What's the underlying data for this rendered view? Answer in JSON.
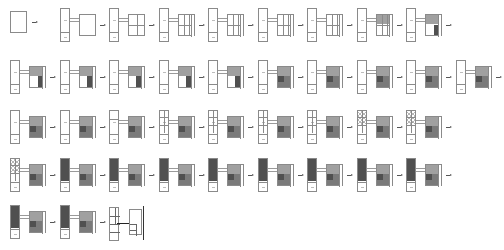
{
  "diagram": {
    "title": "",
    "colors": {
      "line": "#8a8a8a",
      "fill_light": "#a0a0a0",
      "fill_mid": "#7a7a7a",
      "fill_dark": "#505050",
      "arrow": "#555555",
      "background": "#ffffff"
    },
    "rows": [
      {
        "row": 1,
        "steps": [
          {
            "id": 1,
            "variant": "single-square",
            "fill": "empty"
          },
          {
            "id": 2,
            "variant": "tower-square",
            "fill": "empty"
          },
          {
            "id": 3,
            "variant": "tower-square",
            "fill": "grid-2x2"
          },
          {
            "id": 4,
            "variant": "tower-square",
            "fill": "grid-3x2"
          },
          {
            "id": 5,
            "variant": "tower-square",
            "fill": "crossed-grid"
          },
          {
            "id": 6,
            "variant": "tower-square",
            "fill": "crossed-grid"
          },
          {
            "id": 7,
            "variant": "tower-square",
            "fill": "crossed-grid"
          },
          {
            "id": 8,
            "variant": "tower-square",
            "fill": "partial-shade"
          },
          {
            "id": 9,
            "variant": "tower-square",
            "fill": "partial-shade-dark"
          }
        ]
      },
      {
        "row": 2,
        "steps": [
          {
            "id": 10,
            "variant": "tower-square",
            "fill": "shaded-L"
          },
          {
            "id": 11,
            "variant": "tower-square",
            "fill": "shaded-dots"
          },
          {
            "id": 12,
            "variant": "tower-square",
            "fill": "shaded-dots"
          },
          {
            "id": 13,
            "variant": "tower-square",
            "fill": "shaded-dots"
          },
          {
            "id": 14,
            "variant": "tower-square",
            "fill": "shaded-dots"
          },
          {
            "id": 15,
            "variant": "tower-square",
            "fill": "shaded-full"
          },
          {
            "id": 16,
            "variant": "tower-square",
            "fill": "shaded-full"
          },
          {
            "id": 17,
            "variant": "tower-square",
            "fill": "shaded-full"
          },
          {
            "id": 18,
            "variant": "tower-square",
            "fill": "shaded-full"
          },
          {
            "id": 19,
            "variant": "tower-square",
            "fill": "shaded-full"
          }
        ]
      },
      {
        "row": 3,
        "steps": [
          {
            "id": 20,
            "variant": "tower-square",
            "fill": "shaded-full"
          },
          {
            "id": 21,
            "variant": "tower-square",
            "fill": "shaded-full"
          },
          {
            "id": 22,
            "variant": "tower-divided",
            "fill": "shaded-full"
          },
          {
            "id": 23,
            "variant": "tower-grid",
            "fill": "shaded-full"
          },
          {
            "id": 24,
            "variant": "tower-grid",
            "fill": "shaded-full"
          },
          {
            "id": 25,
            "variant": "tower-grid",
            "fill": "shaded-full"
          },
          {
            "id": 26,
            "variant": "tower-grid",
            "fill": "shaded-full"
          },
          {
            "id": 27,
            "variant": "tower-detail",
            "fill": "shaded-full"
          },
          {
            "id": 28,
            "variant": "tower-detail",
            "fill": "shaded-full"
          }
        ]
      },
      {
        "row": 4,
        "steps": [
          {
            "id": 29,
            "variant": "tower-detail",
            "fill": "shaded-full"
          },
          {
            "id": 30,
            "variant": "tower-shaded",
            "fill": "shaded-full"
          },
          {
            "id": 31,
            "variant": "tower-shaded",
            "fill": "shaded-full"
          },
          {
            "id": 32,
            "variant": "tower-shaded",
            "fill": "shaded-full"
          },
          {
            "id": 33,
            "variant": "tower-shaded",
            "fill": "shaded-full"
          },
          {
            "id": 34,
            "variant": "tower-shaded",
            "fill": "shaded-full"
          },
          {
            "id": 35,
            "variant": "tower-shaded",
            "fill": "shaded-full"
          },
          {
            "id": 36,
            "variant": "tower-shaded",
            "fill": "shaded-full"
          },
          {
            "id": 37,
            "variant": "tower-shaded",
            "fill": "shaded-full"
          }
        ]
      },
      {
        "row": 5,
        "steps": [
          {
            "id": 38,
            "variant": "tower-shaded",
            "fill": "shaded-full"
          },
          {
            "id": 39,
            "variant": "tower-shaded",
            "fill": "shaded-full"
          },
          {
            "id": 40,
            "variant": "final-plan",
            "fill": "line-drawing"
          }
        ]
      }
    ]
  }
}
